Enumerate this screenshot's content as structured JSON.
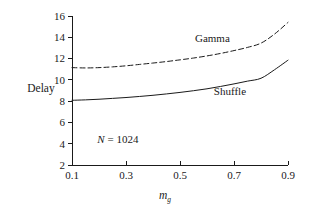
{
  "chart_data": {
    "type": "line",
    "title": "",
    "subtitle": "",
    "xlabel": "m_g",
    "xlabel_base": "m",
    "xlabel_sub": "g",
    "ylabel": "Delay",
    "xlim": [
      0.1,
      0.9
    ],
    "ylim": [
      2,
      16
    ],
    "grid": false,
    "legend_position": "inline-annotation",
    "xticks": [
      "0.1",
      "0.3",
      "0.5",
      "0.7",
      "0.9"
    ],
    "xtick_values": [
      0.1,
      0.3,
      0.5,
      0.7,
      0.9
    ],
    "yticks": [
      "2",
      "4",
      "6",
      "8",
      "10",
      "12",
      "14",
      "16"
    ],
    "ytick_values": [
      2,
      4,
      6,
      8,
      10,
      12,
      14,
      16
    ],
    "annotations": [
      {
        "text": "N = 1024",
        "text_base": "N",
        "text_rest": " = 1024",
        "x": 0.27,
        "y": 4.1
      }
    ],
    "series": [
      {
        "name": "Gamma",
        "style": "dashed",
        "color": "#1a1a1a",
        "label_x": 0.62,
        "label_y": 13.6,
        "x": [
          0.1,
          0.15,
          0.2,
          0.25,
          0.3,
          0.35,
          0.4,
          0.45,
          0.5,
          0.55,
          0.6,
          0.65,
          0.7,
          0.75,
          0.8,
          0.85,
          0.9
        ],
        "values": [
          11.15,
          11.12,
          11.15,
          11.22,
          11.32,
          11.45,
          11.58,
          11.72,
          11.88,
          12.05,
          12.25,
          12.48,
          12.75,
          13.05,
          13.45,
          14.3,
          15.4
        ]
      },
      {
        "name": "Shuffle",
        "style": "solid",
        "color": "#1a1a1a",
        "label_x": 0.685,
        "label_y": 8.55,
        "x": [
          0.1,
          0.15,
          0.2,
          0.25,
          0.3,
          0.35,
          0.4,
          0.45,
          0.5,
          0.55,
          0.6,
          0.65,
          0.7,
          0.75,
          0.8,
          0.85,
          0.9
        ],
        "values": [
          8.08,
          8.12,
          8.18,
          8.26,
          8.34,
          8.44,
          8.55,
          8.68,
          8.82,
          8.98,
          9.16,
          9.38,
          9.62,
          9.88,
          10.15,
          10.95,
          11.85
        ]
      }
    ]
  },
  "geometry": {
    "plot_left": 72,
    "plot_right": 288,
    "plot_top": 16,
    "plot_bottom": 165
  }
}
